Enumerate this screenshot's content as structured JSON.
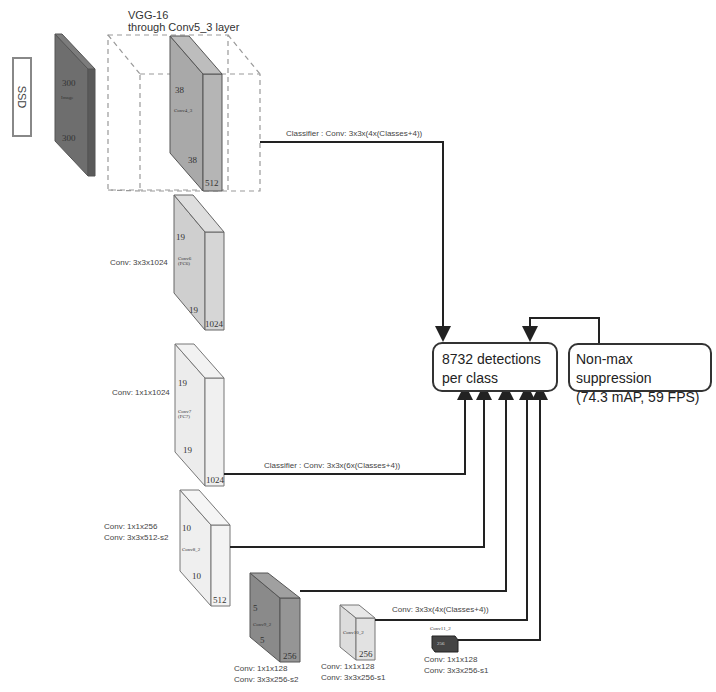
{
  "title": {
    "vgg_line1": "VGG-16",
    "vgg_line2": "through Conv5_3 layer",
    "ssd_label": "SSD"
  },
  "layers": [
    {
      "id": "image",
      "dim_top": "300",
      "name": "Image",
      "dim_bottom": "300",
      "depth": "",
      "color": "#6e6e6e"
    },
    {
      "id": "conv4_3",
      "dim_top": "38",
      "name": "Conv4_3",
      "dim_bottom": "38",
      "depth": "512",
      "color": "#a9a9a9"
    },
    {
      "id": "conv6",
      "dim_top": "19",
      "name": "Conv6 (FC6)",
      "dim_bottom": "19",
      "depth": "1024",
      "conv_label": "Conv: 3x3x1024",
      "color": "#cfcfcf"
    },
    {
      "id": "conv7",
      "dim_top": "19",
      "name": "Conv7 (FC7)",
      "dim_bottom": "19",
      "depth": "1024",
      "conv_label": "Conv: 1x1x1024",
      "color": "#ebebeb"
    },
    {
      "id": "conv8_2",
      "dim_top": "10",
      "name": "Conv8_2",
      "dim_bottom": "10",
      "depth": "512",
      "conv_label_1": "Conv: 1x1x256",
      "conv_label_2": "Conv: 3x3x512-s2",
      "color": "#efefef"
    },
    {
      "id": "conv9_2",
      "dim_top": "5",
      "name": "Conv9_2",
      "dim_bottom": "5",
      "depth": "256",
      "conv_label_1": "Conv: 1x1x128",
      "conv_label_2": "Conv: 3x3x256-s2",
      "color": "#8a8a8a"
    },
    {
      "id": "conv10_2",
      "dim_top": "3",
      "name": "Conv10_2",
      "depth": "256",
      "conv_label_1": "Conv: 1x1x128",
      "conv_label_2": "Conv: 3x3x256-s1",
      "color": "#dcdcdc"
    },
    {
      "id": "conv11_2",
      "name": "Conv11_2",
      "depth": "256",
      "conv_label_1": "Conv: 1x1x128",
      "conv_label_2": "Conv: 3x3x256-s1",
      "color": "#444444"
    }
  ],
  "classifiers": {
    "top": "Classifier : Conv: 3x3x(4x(Classes+4))",
    "middle": "Classifier : Conv: 3x3x(6x(Classes+4))",
    "bottom": "Conv: 3x3x(4x(Classes+4))"
  },
  "outputs": {
    "detections_line1": "8732 detections",
    "detections_line2": "per class",
    "nms_line1": "Non-max suppression",
    "nms_line2": "(74.3 mAP, 59 FPS)"
  }
}
